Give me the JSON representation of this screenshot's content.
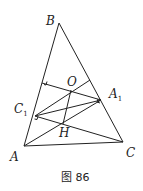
{
  "figure": {
    "caption": "图 86",
    "labels": {
      "B": "B",
      "O": "O",
      "C1_main": "C",
      "C1_sub": "1",
      "A1_main": "A",
      "A1_sub": "1",
      "H": "H",
      "A": "A",
      "C": "C"
    },
    "points": {
      "A": [
        24,
        146
      ],
      "B": [
        59,
        23
      ],
      "C": [
        123,
        142
      ],
      "C1": [
        35,
        116
      ],
      "A1": [
        101,
        100
      ],
      "O": [
        71,
        90
      ],
      "H": [
        63,
        124
      ],
      "P_AB": [
        42,
        83
      ],
      "P_BC": [
        90,
        80
      ]
    }
  }
}
